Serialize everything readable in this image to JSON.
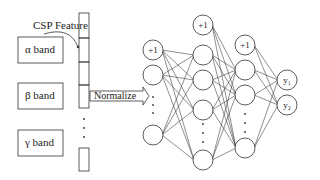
{
  "feature_label": "CSP Feature",
  "normalize_label": "Normalize",
  "bands": [
    {
      "label": "α band"
    },
    {
      "label": "β band"
    },
    {
      "label": "γ band"
    }
  ],
  "network": {
    "bias_label": "+1",
    "outputs": [
      {
        "label": "y₁"
      },
      {
        "label": "y₂"
      }
    ]
  },
  "colors": {
    "stroke": "#333333",
    "background": "#ffffff"
  }
}
